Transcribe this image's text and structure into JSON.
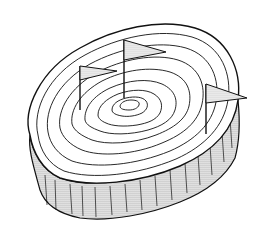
{
  "image": {
    "subject": "Tree stump with growth rings drawn like topographic contour lines, with three pennant flags planted on top",
    "style": "black ink line art with dotted halftone shading",
    "colors": {
      "background": "#ffffff",
      "ink": "#111111",
      "shade": "#9a9a9a"
    },
    "flags": [
      {
        "name": "left-flag"
      },
      {
        "name": "center-flag"
      },
      {
        "name": "right-flag"
      }
    ],
    "ring_count": 8
  }
}
